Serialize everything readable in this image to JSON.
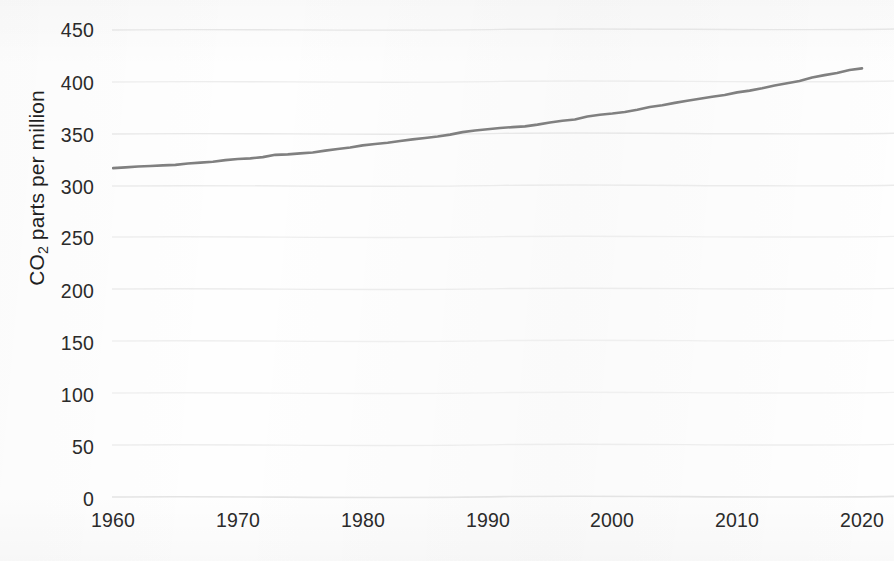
{
  "figure": {
    "background_color": "#fefefe",
    "line_color": "#808080",
    "gridline_color": "#e9e9e9",
    "text_color": "#2b2b2b"
  },
  "yaxis": {
    "title_prefix": "CO",
    "title_sub": "2",
    "title_suffix": " parts per million",
    "ticks": [
      "450",
      "400",
      "350",
      "300",
      "250",
      "200",
      "150",
      "100",
      "50",
      "0"
    ]
  },
  "xaxis": {
    "ticks": [
      "1960",
      "1970",
      "1980",
      "1990",
      "2000",
      "2010",
      "2020"
    ]
  },
  "edge_text": {
    "top_right_clipped": "y",
    "bottom_left_clipped": "CO  Up on the rise"
  },
  "chart_data": {
    "type": "line",
    "title": "",
    "xlabel": "",
    "ylabel": "CO2 parts per million",
    "xlim": [
      1959,
      2021
    ],
    "ylim": [
      0,
      470
    ],
    "yticks": [
      0,
      50,
      100,
      150,
      200,
      250,
      300,
      350,
      400,
      450
    ],
    "xticks": [
      1960,
      1970,
      1980,
      1990,
      2000,
      2010,
      2020
    ],
    "grid": "horizontal-only",
    "legend": "none",
    "series": [
      {
        "name": "Atmospheric CO2 concentration",
        "color": "#808080",
        "x": [
          1960,
          1961,
          1962,
          1963,
          1964,
          1965,
          1966,
          1967,
          1968,
          1969,
          1970,
          1971,
          1972,
          1973,
          1974,
          1975,
          1976,
          1977,
          1978,
          1979,
          1980,
          1981,
          1982,
          1983,
          1984,
          1985,
          1986,
          1987,
          1988,
          1989,
          1990,
          1991,
          1992,
          1993,
          1994,
          1995,
          1996,
          1997,
          1998,
          1999,
          2000,
          2001,
          2002,
          2003,
          2004,
          2005,
          2006,
          2007,
          2008,
          2009,
          2010,
          2011,
          2012,
          2013,
          2014,
          2015,
          2016,
          2017,
          2018,
          2019,
          2020
        ],
        "values": [
          316.9,
          317.6,
          318.5,
          319.0,
          319.6,
          320.0,
          321.4,
          322.2,
          323.0,
          324.6,
          325.7,
          326.3,
          327.5,
          329.7,
          330.2,
          331.1,
          332.0,
          333.8,
          335.4,
          336.8,
          338.8,
          340.1,
          341.4,
          343.0,
          344.6,
          346.0,
          347.4,
          349.2,
          351.6,
          353.1,
          354.4,
          355.6,
          356.4,
          357.1,
          358.8,
          360.8,
          362.6,
          363.7,
          366.7,
          368.4,
          369.5,
          371.0,
          373.2,
          375.8,
          377.5,
          379.8,
          381.9,
          383.8,
          385.6,
          387.4,
          389.9,
          391.6,
          393.8,
          396.5,
          398.6,
          400.8,
          404.2,
          406.5,
          408.5,
          411.4,
          413.0
        ]
      }
    ]
  }
}
